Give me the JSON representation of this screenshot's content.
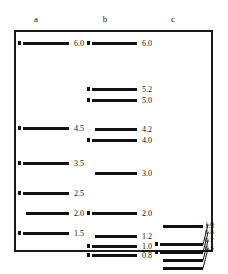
{
  "figure": {
    "type": "gel-electrophoresis-lane-diagram",
    "frame_color": "#1a1a1a",
    "band_color": "#111111",
    "background": "#ffffff",
    "units": "kb",
    "columns": [
      {
        "id": "a",
        "header": "a",
        "bands": [
          {
            "label": "6.0",
            "y": 10,
            "marker": true
          },
          {
            "label": "4.5",
            "y": 95,
            "marker": true
          },
          {
            "label": "3.5",
            "y": 130,
            "marker": true
          },
          {
            "label": "2.5",
            "y": 160,
            "marker": true
          },
          {
            "label": "2.0",
            "y": 180,
            "marker": false
          },
          {
            "label": "1.5",
            "y": 200,
            "marker": true
          }
        ]
      },
      {
        "id": "b",
        "header": "b",
        "bands": [
          {
            "label": "6.0",
            "y": 10,
            "marker": true
          },
          {
            "label": "5.2",
            "y": 56,
            "marker": true
          },
          {
            "label": "5.0",
            "y": 67,
            "marker": true
          },
          {
            "label": "4.2",
            "y": 96,
            "marker": false
          },
          {
            "label": "4.0",
            "y": 107,
            "marker": true
          },
          {
            "label": "3.0",
            "y": 140,
            "marker": false
          },
          {
            "label": "2.0",
            "y": 180,
            "marker": true
          },
          {
            "label": "1.2",
            "y": 203,
            "marker": false
          },
          {
            "label": "1.0",
            "y": 213,
            "marker": true
          },
          {
            "label": "0.8",
            "y": 222,
            "marker": true
          }
        ]
      },
      {
        "id": "c",
        "header": "c",
        "bands": [
          {
            "label": "1.5",
            "y": 193,
            "marker": false
          },
          {
            "label": "1.0",
            "y": 211,
            "marker": true
          },
          {
            "label": "0.8",
            "y": 219,
            "marker": true
          },
          {
            "label": "0.7",
            "y": 227,
            "marker": false
          },
          {
            "label": "0.5",
            "y": 235,
            "marker": false
          }
        ]
      }
    ]
  }
}
